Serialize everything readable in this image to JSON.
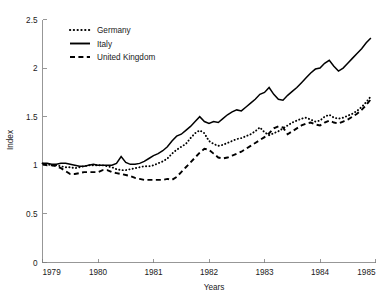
{
  "chart_data": {
    "type": "line",
    "title": "",
    "xlabel": "Years",
    "ylabel": "Index",
    "xlim": [
      1979,
      1985
    ],
    "ylim": [
      0,
      2.5
    ],
    "xticks": [
      1979,
      1980,
      1981,
      1982,
      1983,
      1984,
      1985
    ],
    "xtick_labels": [
      "1979",
      "1980",
      "1981",
      "1982",
      "1983",
      "1984",
      "1985"
    ],
    "yticks": [
      0,
      0.5,
      1,
      1.5,
      2,
      2.5
    ],
    "ytick_labels": [
      "0",
      "0.5",
      "1",
      "1.5",
      "2",
      "2.5"
    ],
    "grid": false,
    "legend_position": "upper-left",
    "line_color": "#000000",
    "axis_color": "#7d7d7d",
    "x": [
      1979.0,
      1979.083,
      1979.167,
      1979.25,
      1979.333,
      1979.417,
      1979.5,
      1979.583,
      1979.667,
      1979.75,
      1979.833,
      1979.917,
      1980.0,
      1980.083,
      1980.167,
      1980.25,
      1980.333,
      1980.417,
      1980.5,
      1980.583,
      1980.667,
      1980.75,
      1980.833,
      1980.917,
      1981.0,
      1981.083,
      1981.167,
      1981.25,
      1981.333,
      1981.417,
      1981.5,
      1981.583,
      1981.667,
      1981.75,
      1981.833,
      1981.917,
      1982.0,
      1982.083,
      1982.167,
      1982.25,
      1982.333,
      1982.417,
      1982.5,
      1982.583,
      1982.667,
      1982.75,
      1982.833,
      1982.917,
      1983.0,
      1983.083,
      1983.167,
      1983.25,
      1983.333,
      1983.417,
      1983.5,
      1983.583,
      1983.667,
      1983.75,
      1983.833,
      1983.917,
      1984.0,
      1984.083,
      1984.167,
      1984.25,
      1984.333,
      1984.417,
      1984.5,
      1984.583,
      1984.667,
      1984.75,
      1984.833,
      1984.917
    ],
    "series": [
      {
        "name": "Germany",
        "style": "dotted",
        "values": [
          1.02,
          1.01,
          1.0,
          1.0,
          0.99,
          0.98,
          0.98,
          0.97,
          0.98,
          0.99,
          1.0,
          1.0,
          1.0,
          1.0,
          0.99,
          0.98,
          0.96,
          0.95,
          0.95,
          0.96,
          0.97,
          0.98,
          0.99,
          0.99,
          1.0,
          1.02,
          1.04,
          1.07,
          1.12,
          1.16,
          1.19,
          1.22,
          1.28,
          1.33,
          1.36,
          1.33,
          1.25,
          1.22,
          1.2,
          1.21,
          1.23,
          1.25,
          1.27,
          1.28,
          1.3,
          1.32,
          1.35,
          1.39,
          1.34,
          1.31,
          1.33,
          1.35,
          1.38,
          1.41,
          1.44,
          1.46,
          1.48,
          1.49,
          1.47,
          1.45,
          1.46,
          1.5,
          1.52,
          1.49,
          1.48,
          1.49,
          1.51,
          1.53,
          1.56,
          1.6,
          1.65,
          1.71
        ]
      },
      {
        "name": "Italy",
        "style": "solid",
        "values": [
          1.02,
          1.02,
          1.01,
          1.01,
          1.02,
          1.02,
          1.01,
          1.0,
          0.99,
          0.99,
          1.0,
          1.01,
          1.0,
          1.0,
          1.0,
          1.0,
          1.02,
          1.09,
          1.03,
          1.01,
          1.01,
          1.02,
          1.04,
          1.07,
          1.1,
          1.12,
          1.15,
          1.19,
          1.25,
          1.3,
          1.32,
          1.36,
          1.4,
          1.45,
          1.5,
          1.45,
          1.43,
          1.45,
          1.44,
          1.48,
          1.52,
          1.55,
          1.57,
          1.56,
          1.6,
          1.64,
          1.68,
          1.73,
          1.75,
          1.8,
          1.73,
          1.68,
          1.67,
          1.72,
          1.76,
          1.8,
          1.85,
          1.9,
          1.95,
          1.99,
          2.0,
          2.05,
          2.08,
          2.02,
          1.97,
          2.0,
          2.05,
          2.1,
          2.15,
          2.2,
          2.26,
          2.31
        ]
      },
      {
        "name": "United Kingdom",
        "style": "dashed",
        "values": [
          1.01,
          1.0,
          1.0,
          0.99,
          0.97,
          0.94,
          0.91,
          0.91,
          0.92,
          0.93,
          0.93,
          0.93,
          0.93,
          0.95,
          0.95,
          0.93,
          0.92,
          0.91,
          0.9,
          0.89,
          0.87,
          0.86,
          0.85,
          0.85,
          0.85,
          0.85,
          0.85,
          0.86,
          0.85,
          0.88,
          0.93,
          0.98,
          1.03,
          1.08,
          1.13,
          1.17,
          1.16,
          1.12,
          1.08,
          1.07,
          1.08,
          1.1,
          1.12,
          1.14,
          1.17,
          1.2,
          1.23,
          1.26,
          1.29,
          1.33,
          1.38,
          1.4,
          1.39,
          1.32,
          1.35,
          1.38,
          1.41,
          1.43,
          1.44,
          1.42,
          1.41,
          1.44,
          1.46,
          1.44,
          1.43,
          1.45,
          1.47,
          1.5,
          1.53,
          1.57,
          1.62,
          1.68
        ]
      }
    ]
  },
  "legend": {
    "items": [
      {
        "label": "Germany",
        "style": "dotted"
      },
      {
        "label": "Italy",
        "style": "solid"
      },
      {
        "label": "United Kingdom",
        "style": "dashed"
      }
    ]
  }
}
